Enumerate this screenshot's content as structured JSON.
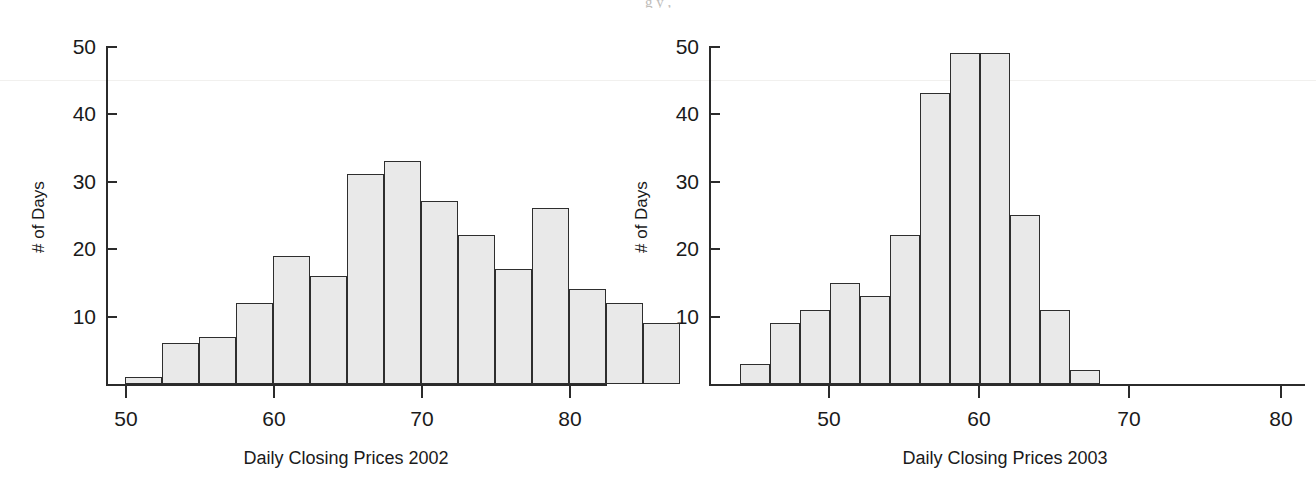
{
  "figure": {
    "background_color": "#ffffff",
    "bar_fill_color": "#e9e9e9",
    "bar_stroke_color": "#2e2e2e",
    "axis_color": "#2b2b2b",
    "cropped_caption_top": "g                                        y                         ,"
  },
  "chart_data": [
    {
      "type": "bar",
      "title": "",
      "xlabel": "Daily Closing Prices 2002",
      "ylabel": "# of Days",
      "xlim": [
        47.5,
        82.5
      ],
      "ylim": [
        0,
        50
      ],
      "xticks": [
        50,
        60,
        70,
        80
      ],
      "yticks": [
        10,
        20,
        30,
        40,
        50
      ],
      "grid": false,
      "legend": "none",
      "bin_width": 2.5,
      "bin_starts": [
        50,
        52.5,
        55,
        57.5,
        60,
        62.5,
        65,
        67.5,
        70,
        72.5,
        75,
        77.5
      ],
      "categories": [
        "50-52.5",
        "52.5-55",
        "55-57.5",
        "57.5-60",
        "60-62.5",
        "62.5-65",
        "65-67.5",
        "67.5-70",
        "70-72.5",
        "72.5-75",
        "75-77.5",
        "77.5-80"
      ],
      "values": [
        1,
        6,
        7,
        12,
        19,
        16,
        31,
        33,
        27,
        22,
        17,
        26,
        14,
        12,
        9
      ]
    },
    {
      "type": "bar",
      "title": "",
      "xlabel": "Daily Closing Prices 2003",
      "ylabel": "# of Days",
      "xlim": [
        42.5,
        82.5
      ],
      "ylim": [
        0,
        50
      ],
      "xticks": [
        50,
        60,
        70,
        80
      ],
      "yticks": [
        10,
        20,
        30,
        40,
        50
      ],
      "grid": false,
      "legend": "none",
      "bin_width": 2,
      "bin_starts": [
        44,
        46,
        48,
        50,
        52,
        54,
        56,
        58,
        60,
        62,
        64,
        66
      ],
      "categories": [
        "44-46",
        "46-48",
        "48-50",
        "50-52",
        "52-54",
        "54-56",
        "56-58",
        "58-60",
        "60-62",
        "62-64",
        "64-66",
        "66-68"
      ],
      "values": [
        3,
        9,
        11,
        15,
        13,
        22,
        43,
        49,
        49,
        25,
        11,
        2
      ]
    }
  ],
  "panels": [
    {
      "name": "panel-2002",
      "ylabel": "# of Days",
      "xlabel": "Daily Closing Prices 2002",
      "yticks": [
        {
          "label": "50",
          "y": 46
        },
        {
          "label": "40",
          "y": 113
        },
        {
          "label": "30",
          "y": 181
        },
        {
          "label": "20",
          "y": 248
        },
        {
          "label": "10",
          "y": 316
        }
      ],
      "xticks": [
        {
          "label": "50",
          "x": 125
        },
        {
          "label": "60",
          "x": 273
        },
        {
          "label": "70",
          "x": 421
        },
        {
          "label": "80",
          "x": 569
        }
      ],
      "bars": [
        {
          "label": "50-52.5",
          "value": 1,
          "x": 125,
          "w": 37
        },
        {
          "label": "52.5-55",
          "value": 6,
          "x": 162,
          "w": 37
        },
        {
          "label": "55-57.5",
          "value": 7,
          "x": 199,
          "w": 37
        },
        {
          "label": "57.5-60",
          "value": 12,
          "x": 236,
          "w": 37
        },
        {
          "label": "60-62.5",
          "value": 19,
          "x": 273,
          "w": 37
        },
        {
          "label": "62.5-65",
          "value": 16,
          "x": 310,
          "w": 37
        },
        {
          "label": "65-67.5",
          "value": 31,
          "x": 347,
          "w": 37
        },
        {
          "label": "67.5-70",
          "value": 33,
          "x": 384,
          "w": 37
        },
        {
          "label": "70-72.5",
          "value": 27,
          "x": 421,
          "w": 37
        },
        {
          "label": "72.5-75",
          "value": 22,
          "x": 458,
          "w": 37
        },
        {
          "label": "75-77.5",
          "value": 17,
          "x": 495,
          "w": 37
        },
        {
          "label": "77.5-80",
          "value": 26,
          "x": 532,
          "w": 37
        },
        {
          "label": "80-82.5",
          "value": 14,
          "x": 569,
          "w": 37
        },
        {
          "label": "82.5-85",
          "value": 12,
          "x": 606,
          "w": 37
        },
        {
          "label": "85-87.5",
          "value": 9,
          "x": 643,
          "w": 37
        }
      ]
    },
    {
      "name": "panel-2003",
      "ylabel": "# of Days",
      "xlabel": "Daily Closing Prices 2003",
      "yticks": [
        {
          "label": "50",
          "y": 46
        },
        {
          "label": "40",
          "y": 113
        },
        {
          "label": "30",
          "y": 181
        },
        {
          "label": "20",
          "y": 248
        },
        {
          "label": "10",
          "y": 316
        }
      ],
      "xticks": [
        {
          "label": "50",
          "x": 828
        },
        {
          "label": "60",
          "x": 978
        },
        {
          "label": "70",
          "x": 1128
        },
        {
          "label": "80",
          "x": 1280
        }
      ],
      "bars": [
        {
          "label": "44-46",
          "value": 3,
          "x": 740,
          "w": 30
        },
        {
          "label": "46-48",
          "value": 9,
          "x": 770,
          "w": 30
        },
        {
          "label": "48-50",
          "value": 11,
          "x": 800,
          "w": 30
        },
        {
          "label": "50-52",
          "value": 15,
          "x": 830,
          "w": 30
        },
        {
          "label": "52-54",
          "value": 13,
          "x": 860,
          "w": 30
        },
        {
          "label": "54-56",
          "value": 22,
          "x": 890,
          "w": 30
        },
        {
          "label": "56-58",
          "value": 43,
          "x": 920,
          "w": 30
        },
        {
          "label": "58-60",
          "value": 49,
          "x": 950,
          "w": 30
        },
        {
          "label": "60-62",
          "value": 49,
          "x": 980,
          "w": 30
        },
        {
          "label": "62-64",
          "value": 25,
          "x": 1010,
          "w": 30
        },
        {
          "label": "64-66",
          "value": 11,
          "x": 1040,
          "w": 30
        },
        {
          "label": "66-68",
          "value": 2,
          "x": 1070,
          "w": 30
        }
      ]
    }
  ]
}
